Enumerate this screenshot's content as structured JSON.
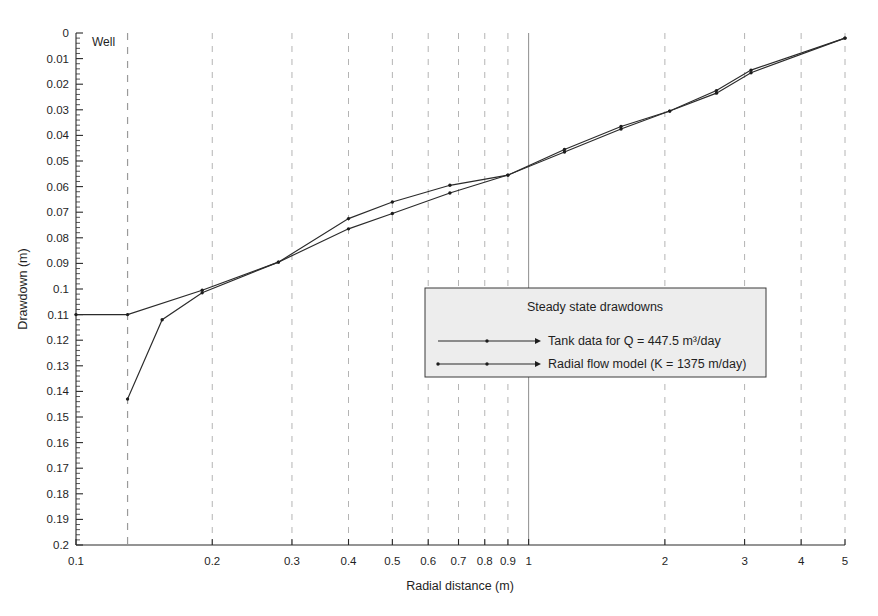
{
  "chart_data": {
    "type": "line",
    "title": "",
    "xlabel": "Radial distance (m)",
    "ylabel": "Drawdown (m)",
    "xscale": "log",
    "yscale": "linear",
    "y_inverted": true,
    "xlim": [
      0.1,
      5
    ],
    "ylim": [
      0,
      0.2
    ],
    "grid": "dashed vertical gridlines at each labelled decade tick; solid vertical line at x = 1",
    "legend_position": "center-right inside axes",
    "x_ticks": [
      0.1,
      0.2,
      0.3,
      0.4,
      0.5,
      0.6,
      0.7,
      0.8,
      0.9,
      1,
      2,
      3,
      4,
      5
    ],
    "x_tick_labels": [
      "0.1",
      "0.2",
      "0.3",
      "0.4",
      "0.5",
      "0.6",
      "0.7",
      "0.8",
      "0.9",
      "1",
      "2",
      "3",
      "4",
      "5"
    ],
    "y_ticks": [
      0,
      0.01,
      0.02,
      0.03,
      0.04,
      0.05,
      0.06,
      0.07,
      0.08,
      0.09,
      0.1,
      0.11,
      0.12,
      0.13,
      0.14,
      0.15,
      0.16,
      0.17,
      0.18,
      0.19,
      0.2
    ],
    "y_tick_labels": [
      "0",
      "0.01",
      "0.02",
      "0.03",
      "0.04",
      "0.05",
      "0.06",
      "0.07",
      "0.08",
      "0.09",
      "0.1",
      "0.11",
      "0.12",
      "0.13",
      "0.14",
      "0.15",
      "0.16",
      "0.17",
      "0.18",
      "0.19",
      "0.2"
    ],
    "annotations": [
      {
        "text": "Well",
        "x": 0.13,
        "y": 0.004,
        "note": "label beside dashed well radius line"
      }
    ],
    "reference_lines": [
      {
        "name": "well-radius",
        "x": 0.13,
        "style": "dashed"
      },
      {
        "name": "unit-distance",
        "x": 1.0,
        "style": "solid"
      }
    ],
    "series": [
      {
        "name": "Tank data for Q = 447.5 m³/day",
        "marker": "dot",
        "x": [
          0.13,
          0.155,
          0.19,
          0.28,
          0.4,
          0.5,
          0.67,
          0.9,
          1.2,
          1.6,
          2.05,
          2.6,
          3.1,
          5.0
        ],
        "y": [
          0.143,
          0.112,
          0.1015,
          0.0895,
          0.0725,
          0.066,
          0.0595,
          0.0555,
          0.0455,
          0.0365,
          0.0305,
          0.0225,
          0.0145,
          0.002
        ]
      },
      {
        "name": "Radial flow model   (K = 1375 m/day)",
        "marker": "dot",
        "x": [
          0.1,
          0.13,
          0.19,
          0.28,
          0.4,
          0.5,
          0.67,
          0.9,
          1.2,
          1.6,
          2.05,
          2.6,
          3.1,
          5.0
        ],
        "y": [
          0.11,
          0.11,
          0.1005,
          0.0895,
          0.0765,
          0.0705,
          0.0625,
          0.0555,
          0.0465,
          0.0375,
          0.0305,
          0.0235,
          0.0155,
          0.002
        ]
      }
    ]
  },
  "legend": {
    "title": "Steady state drawdowns",
    "entries": [
      "Tank data for Q = 447.5 m³/day",
      "Radial flow model   (K = 1375 m/day)"
    ]
  },
  "axes": {
    "x_title": "Radial distance (m)",
    "y_title": "Drawdown (m)"
  },
  "annotations": {
    "well": "Well"
  },
  "colors": {
    "background": "#ffffff",
    "axis": "#2a2a2a",
    "gridline_dashed": "#b4b4b4",
    "gridline_solid": "#8d8d8d",
    "series_line": "#2b2b2b",
    "legend_fill": "#ededed",
    "legend_border": "#3a3a3a",
    "text": "#1f1f1f"
  }
}
